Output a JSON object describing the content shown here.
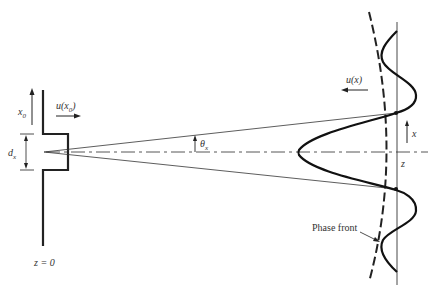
{
  "figure": {
    "labels": {
      "x0": "x",
      "x0_sub": "0",
      "u_x0_pre": "u(x",
      "u_x0_sub": "0",
      "u_x0_post": ")",
      "dx": "d",
      "dx_sub": "x",
      "theta": "θ",
      "theta_sub": "x",
      "u_x": "u(x)",
      "x": "x",
      "z": "z",
      "z0": "z = 0",
      "phase_front": "Phase front"
    },
    "colors": {
      "ink": "#222222",
      "text": "#333333"
    }
  }
}
